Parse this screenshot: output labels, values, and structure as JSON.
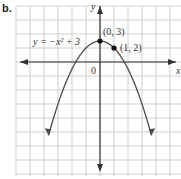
{
  "part_label": "b.",
  "chart_data": {
    "type": "line",
    "title": "",
    "equation": "y = −x² + 3",
    "xlabel": "x",
    "ylabel": "y",
    "origin_label": "0",
    "grid": true,
    "xlim": [
      -6,
      6
    ],
    "ylim": [
      -15,
      9
    ],
    "series": [
      {
        "name": "y = -x^2 + 3",
        "x": [
          -3.5,
          -3,
          -2,
          -1,
          0,
          1,
          2,
          3,
          3.5
        ],
        "y": [
          -9.25,
          -6,
          -1,
          2,
          3,
          2,
          -1,
          -6,
          -9.25
        ]
      }
    ],
    "points": [
      {
        "label": "(0, 3)",
        "x": 0,
        "y": 3
      },
      {
        "label": "(1, 2)",
        "x": 1,
        "y": 2
      }
    ],
    "annotations": [
      "y = −x² + 3",
      "(0, 3)",
      "(1, 2)"
    ]
  },
  "colors": {
    "grid": "#cfcfcf",
    "axis": "#333333",
    "curve": "#4a4a4a",
    "point": "#111111"
  }
}
